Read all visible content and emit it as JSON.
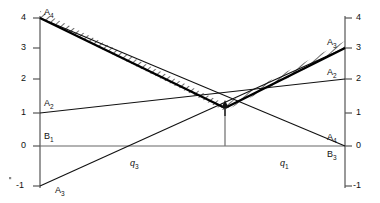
{
  "figure": {
    "type": "line-diagram",
    "background": "#ffffff",
    "line_color": "#111111",
    "axis_color": "#555555",
    "envelope_color": "#000000",
    "hatch_color": "#333333"
  },
  "axes": {
    "left_axis_label": "",
    "right_axis_label": "",
    "x_axis_label": "",
    "y_ticks_left": [
      "4",
      "3",
      "2",
      "1",
      "0",
      "-1"
    ],
    "y_ticks_right": [
      "4",
      "3",
      "2",
      "1",
      "0",
      "-1"
    ],
    "ylim": [
      -1,
      4
    ],
    "xlim": [
      0,
      1
    ]
  },
  "point_labels": {
    "top_left": "A4",
    "left_mid": "A2",
    "left_zero": "B1",
    "bottom_left": "A3",
    "right_top": "A3",
    "right_mid": "A2",
    "right_low": "A4",
    "right_zero": "B3"
  },
  "segment_labels": {
    "left": "q3",
    "right": "q1"
  },
  "chart_data": {
    "type": "line",
    "title": "",
    "xlabel": "",
    "ylabel": "",
    "xlim": [
      0,
      1
    ],
    "ylim": [
      -1,
      4
    ],
    "grid": false,
    "legend": "none",
    "x_ticks": [],
    "y_ticks": [
      -1,
      0,
      1,
      2,
      3,
      4
    ],
    "series": [
      {
        "name": "A4",
        "x": [
          0,
          1
        ],
        "values": [
          4,
          0
        ],
        "style": "thin",
        "label_left": "A4",
        "label_right": "A4"
      },
      {
        "name": "A2",
        "x": [
          0,
          1
        ],
        "values": [
          1,
          2
        ],
        "style": "thin",
        "label_left": "A2",
        "label_right": "A2"
      },
      {
        "name": "A3",
        "x": [
          0,
          1
        ],
        "values": [
          -1,
          3
        ],
        "style": "thin",
        "label_left": "A3",
        "label_right": "A3"
      },
      {
        "name": "B1",
        "x": [
          0,
          1
        ],
        "values": [
          0,
          0
        ],
        "style": "axis",
        "label_left": "B1",
        "label_right": "B3"
      },
      {
        "name": "upper-envelope",
        "x": [
          0,
          0.605,
          1
        ],
        "values": [
          4,
          1.58,
          3
        ],
        "style": "thick-hatched"
      }
    ],
    "annotations": [
      {
        "name": "minimum-marker",
        "type": "arrow-up",
        "x": 0.605,
        "y": 1.58
      },
      {
        "name": "minimum-dropline",
        "type": "vertical-line",
        "x": 0.605,
        "y0": 0,
        "y1": 1.58
      },
      {
        "name": "q3",
        "type": "segment-label",
        "x": 0.3,
        "y": -0.22
      },
      {
        "name": "q1",
        "type": "segment-label",
        "x": 0.81,
        "y": -0.22
      }
    ]
  }
}
